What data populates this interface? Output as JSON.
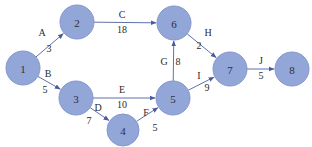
{
  "diagram": {
    "type": "activity-network",
    "colors": {
      "node_fill": "#93a6d8",
      "node_stroke": "#8497cc",
      "edge": "#5f72aa",
      "text": "#2a2a2a"
    },
    "nodes": [
      {
        "id": "1",
        "label": "1",
        "x": 23,
        "y": 68,
        "r": 17
      },
      {
        "id": "2",
        "label": "2",
        "x": 77,
        "y": 22,
        "r": 17
      },
      {
        "id": "3",
        "label": "3",
        "x": 76,
        "y": 98,
        "r": 17
      },
      {
        "id": "4",
        "label": "4",
        "x": 123,
        "y": 130,
        "r": 16
      },
      {
        "id": "5",
        "label": "5",
        "x": 173,
        "y": 98,
        "r": 17
      },
      {
        "id": "6",
        "label": "6",
        "x": 174,
        "y": 23,
        "r": 17
      },
      {
        "id": "7",
        "label": "7",
        "x": 230,
        "y": 69,
        "r": 17
      },
      {
        "id": "8",
        "label": "8",
        "x": 292,
        "y": 69,
        "r": 17
      }
    ],
    "edges": [
      {
        "from": "1",
        "to": "2",
        "activity": "A",
        "duration": "3",
        "lx": 42,
        "ly": 32,
        "dx": 49,
        "dy": 48
      },
      {
        "from": "1",
        "to": "3",
        "activity": "B",
        "duration": "5",
        "lx": 48,
        "ly": 73,
        "dx": 45,
        "dy": 89
      },
      {
        "from": "2",
        "to": "6",
        "activity": "C",
        "duration": "18",
        "lx": 122,
        "ly": 14,
        "dx": 122,
        "dy": 29
      },
      {
        "from": "3",
        "to": "5",
        "activity": "E",
        "duration": "10",
        "lx": 122,
        "ly": 89,
        "dx": 122,
        "dy": 104
      },
      {
        "from": "3",
        "to": "4",
        "activity": "D",
        "duration": "7",
        "lx": 98,
        "ly": 107,
        "dx": 89,
        "dy": 120
      },
      {
        "from": "4",
        "to": "5",
        "activity": "F",
        "duration": "5",
        "lx": 146,
        "ly": 112,
        "dx": 155,
        "dy": 127
      },
      {
        "from": "5",
        "to": "6",
        "activity": "G",
        "duration": "8",
        "lx": 164,
        "ly": 61,
        "dx": 178,
        "dy": 61
      },
      {
        "from": "6",
        "to": "7",
        "activity": "H",
        "duration": "2",
        "lx": 208,
        "ly": 32,
        "dx": 199,
        "dy": 45
      },
      {
        "from": "5",
        "to": "7",
        "activity": "I",
        "duration": "9",
        "lx": 199,
        "ly": 75,
        "dx": 207,
        "dy": 87
      },
      {
        "from": "7",
        "to": "8",
        "activity": "J",
        "duration": "5",
        "lx": 261,
        "ly": 60,
        "dx": 261,
        "dy": 75
      }
    ]
  }
}
